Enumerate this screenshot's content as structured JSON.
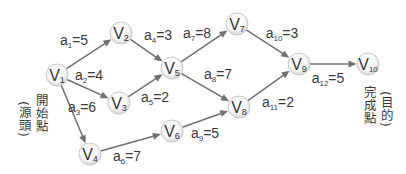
{
  "diagram": {
    "node_radius": 11,
    "colors": {
      "edge": "#707070",
      "text": "#333333",
      "node_fill_center": "#ffffff",
      "node_fill_edge": "#dadada",
      "node_stroke": "#c9c9c9"
    },
    "nodes": [
      {
        "id": "V1",
        "label": "V",
        "sub": "1",
        "x": 57,
        "y": 75
      },
      {
        "id": "V2",
        "label": "V",
        "sub": "2",
        "x": 121,
        "y": 33
      },
      {
        "id": "V3",
        "label": "V",
        "sub": "3",
        "x": 119,
        "y": 103
      },
      {
        "id": "V4",
        "label": "V",
        "sub": "4",
        "x": 90,
        "y": 154
      },
      {
        "id": "V5",
        "label": "V",
        "sub": "5",
        "x": 172,
        "y": 68
      },
      {
        "id": "V6",
        "label": "V",
        "sub": "6",
        "x": 172,
        "y": 131
      },
      {
        "id": "V7",
        "label": "V",
        "sub": "7",
        "x": 237,
        "y": 24
      },
      {
        "id": "V8",
        "label": "V",
        "sub": "8",
        "x": 239,
        "y": 107
      },
      {
        "id": "V9",
        "label": "V",
        "sub": "9",
        "x": 299,
        "y": 64
      },
      {
        "id": "V10",
        "label": "V",
        "sub": "10",
        "x": 368,
        "y": 64
      }
    ],
    "edges": [
      {
        "from": "V1",
        "to": "V2",
        "name": "a",
        "sub": "1",
        "weight": "=5",
        "lx": 74,
        "ly": 40
      },
      {
        "from": "V1",
        "to": "V3",
        "name": "a",
        "sub": "2",
        "weight": "=4",
        "lx": 89,
        "ly": 75
      },
      {
        "from": "V1",
        "to": "V4",
        "name": "a",
        "sub": "3",
        "weight": "=6",
        "lx": 82,
        "ly": 107
      },
      {
        "from": "V2",
        "to": "V5",
        "name": "a",
        "sub": "4",
        "weight": "=3",
        "lx": 158,
        "ly": 35
      },
      {
        "from": "V3",
        "to": "V5",
        "name": "a",
        "sub": "5",
        "weight": "=2",
        "lx": 155,
        "ly": 97
      },
      {
        "from": "V4",
        "to": "V6",
        "name": "a",
        "sub": "6",
        "weight": "=7",
        "lx": 127,
        "ly": 156
      },
      {
        "from": "V5",
        "to": "V7",
        "name": "a",
        "sub": "7",
        "weight": "=8",
        "lx": 197,
        "ly": 33
      },
      {
        "from": "V5",
        "to": "V8",
        "name": "a",
        "sub": "8",
        "weight": "=7",
        "lx": 218,
        "ly": 74
      },
      {
        "from": "V6",
        "to": "V8",
        "name": "a",
        "sub": "9",
        "weight": "=5",
        "lx": 205,
        "ly": 133
      },
      {
        "from": "V7",
        "to": "V9",
        "name": "a",
        "sub": "10",
        "weight": "=3",
        "lx": 282,
        "ly": 33
      },
      {
        "from": "V8",
        "to": "V9",
        "name": "a",
        "sub": "11",
        "weight": "=2",
        "lx": 278,
        "ly": 102
      },
      {
        "from": "V9",
        "to": "V10",
        "name": "a",
        "sub": "12",
        "weight": "=5",
        "lx": 328,
        "ly": 78
      }
    ],
    "annotations": {
      "start_label": "開始點",
      "start_note": "(源頭)",
      "end_label": "完成點",
      "end_note": "(目的)"
    }
  }
}
